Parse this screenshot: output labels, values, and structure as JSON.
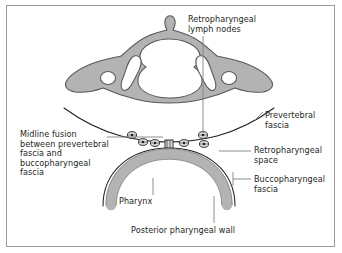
{
  "figure": {
    "border_color": "#9a9a9a",
    "background": "#ffffff"
  },
  "colors": {
    "bone_fill": "#b3b3b3",
    "bone_stroke": "#58595b",
    "foramen_fill": "#ffffff",
    "pharynx_fill": "#b3b3b3",
    "pharynx_stroke": "#808285",
    "fascia_stroke": "#231f20",
    "node_fill": "#d9d9d9",
    "node_stroke": "#231f20",
    "leader_stroke": "#808285",
    "text": "#231f20"
  },
  "labels": {
    "lymph_nodes": "Retropharyngeal\nlymph nodes",
    "prevertebral_fascia": "Prevertebral\nfascia",
    "retropharyngeal_space": "Retropharyngeal\nspace",
    "buccopharyngeal_fascia": "Buccopharyngeal\nfascia",
    "midline_fusion": "Midline fusion\nbetween prevertebral\nfascia and\nbuccopharyngeal\nfascia",
    "pharynx": "Pharynx",
    "posterior_pharyngeal_wall": "Posterior pharyngeal wall"
  },
  "structures": [
    {
      "name": "cervical-vertebra",
      "description": "Axial cross-section of cervical vertebra with spinous process, vertebral foramen, transverse foramina and transverse processes",
      "fill": "#b3b3b3"
    },
    {
      "name": "prevertebral-fascia-line",
      "description": "Curved fascia line passing anterior to vertebral body, sweeping laterally"
    },
    {
      "name": "buccopharyngeal-fascia-line",
      "description": "Curved fascia line surrounding the posterior pharyngeal wall"
    },
    {
      "name": "retropharyngeal-space",
      "description": "Potential space between prevertebral and buccopharyngeal fascia containing lymph nodes"
    },
    {
      "name": "pharynx-arch",
      "description": "Thick arch representing the pharyngeal wall"
    },
    {
      "name": "midline-fusion-point",
      "description": "Central raphe where prevertebral and buccopharyngeal fascia fuse"
    }
  ],
  "lymph_nodes": {
    "count": 6,
    "left_side": 3,
    "right_side": 3,
    "description": "Small oval nodes with stippled interior lying within the retropharyngeal space"
  }
}
